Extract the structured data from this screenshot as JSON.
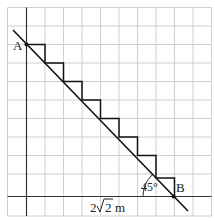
{
  "diagram": {
    "type": "geometry-staircase",
    "labels": {
      "point_a": "A",
      "point_b": "B",
      "angle": "45°",
      "length_prefix": "2",
      "length_radicand": "2",
      "length_unit": "m"
    },
    "grid": {
      "color": "#cfcfcf",
      "axis_color": "#333333",
      "cell_size": 18.5,
      "columns": 11,
      "rows": 11
    },
    "steps": 8,
    "line_color": "#111111"
  }
}
